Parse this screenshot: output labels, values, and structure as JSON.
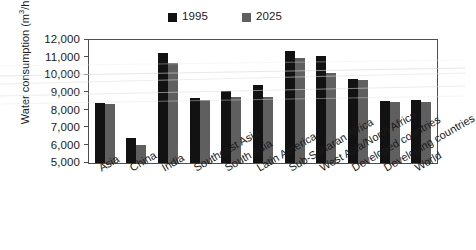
{
  "chart_data": {
    "type": "bar",
    "title": "",
    "xlabel": "",
    "ylabel": "Water consumption (m³/ha)",
    "ylabel_main": "Water consumption (m",
    "ylabel_sup": "3",
    "ylabel_tail": "/ha)",
    "ylim": [
      5000,
      12000
    ],
    "ytick_step": 1000,
    "grid": false,
    "legend_position": "top-center",
    "categories": [
      "Asia",
      "China",
      "India",
      "Southeast Asia",
      "South Asia",
      "Latin America",
      "Sub-Saharan Africa",
      "West Asia/North Africa",
      "Developed countries",
      "Developing countries",
      "World"
    ],
    "ytick_labels": [
      "12,000",
      "11,000",
      "10,000",
      "9,000",
      "8,000",
      "7,000",
      "6,000",
      "5,000"
    ],
    "ytick_values": [
      12000,
      11000,
      10000,
      9000,
      8000,
      7000,
      6000,
      5000
    ],
    "series": [
      {
        "name": "1995",
        "color": "#121212",
        "values": [
          8400,
          6400,
          11250,
          8700,
          9100,
          9450,
          11350,
          11100,
          9800,
          8550,
          8600
        ]
      },
      {
        "name": "2025",
        "color": "#5f5f5f",
        "values": [
          8350,
          6050,
          10700,
          8600,
          8750,
          8750,
          11000,
          10100,
          9750,
          8450,
          8500
        ]
      }
    ]
  },
  "legend": {
    "entries": [
      {
        "label": "1995",
        "color": "#121212"
      },
      {
        "label": "2025",
        "color": "#5f5f5f"
      }
    ]
  }
}
